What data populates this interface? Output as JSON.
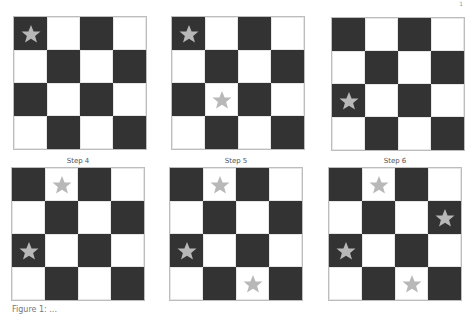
{
  "figure": {
    "grid_rows": 4,
    "grid_cols": 4,
    "colors": {
      "dark_cell": "#333333",
      "light_cell": "#ffffff",
      "star": "#b8b8b8",
      "border": "#bdbdbd"
    },
    "panels": [
      {
        "title": "",
        "left": 14,
        "top": 17,
        "stars": [
          [
            0,
            0
          ]
        ]
      },
      {
        "title": "",
        "left": 172,
        "top": 17,
        "stars": [
          [
            0,
            0
          ],
          [
            2,
            1
          ]
        ]
      },
      {
        "title": "",
        "left": 332,
        "top": 18,
        "stars": [
          [
            2,
            0
          ]
        ]
      },
      {
        "title": "Step 4",
        "left": 12,
        "top": 168,
        "stars": [
          [
            0,
            1
          ],
          [
            2,
            0
          ]
        ]
      },
      {
        "title": "Step 5",
        "left": 170,
        "top": 168,
        "stars": [
          [
            0,
            1
          ],
          [
            2,
            0
          ],
          [
            3,
            2
          ]
        ]
      },
      {
        "title": "Step 6",
        "left": 329,
        "top": 168,
        "stars": [
          [
            0,
            1
          ],
          [
            1,
            3
          ],
          [
            2,
            0
          ],
          [
            3,
            2
          ]
        ]
      }
    ]
  },
  "page_number": "1",
  "caption": "Figure 1: ..."
}
